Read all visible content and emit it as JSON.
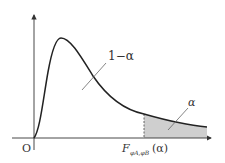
{
  "diagram": {
    "origin_label": "O",
    "x_axis_label": {
      "main": "F",
      "subscript": "φA,φB",
      "argument": "(α)"
    },
    "region_labels": {
      "body": "1−α",
      "tail": "α"
    },
    "colors": {
      "curve": "#222222",
      "axes": "#333333",
      "tail_fill": "#cfcfcf",
      "leader_line": "#666666",
      "background": "#ffffff"
    }
  }
}
